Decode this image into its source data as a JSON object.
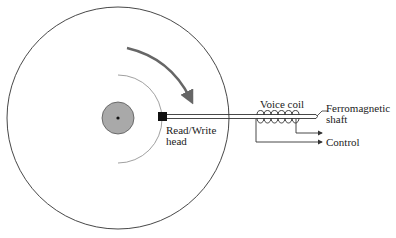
{
  "diagram": {
    "labels": {
      "head_line1": "Read/Write",
      "head_line2": "head",
      "voice_coil": "Voice coil",
      "shaft_line1": "Ferromagnetic",
      "shaft_line2": "shaft",
      "control": "Control"
    },
    "icons": {
      "rotation": "curved-arrow-clockwise"
    },
    "colors": {
      "outline": "#333333",
      "hub_fill": "#a9a9a9",
      "arrow": "#666666",
      "track": "#888888"
    }
  }
}
